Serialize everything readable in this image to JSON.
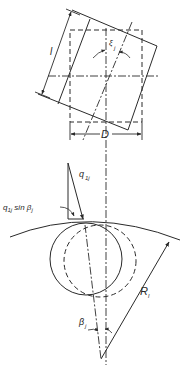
{
  "diagram": {
    "labels": {
      "length": "l",
      "diameter": "D",
      "skew_angle": "ξ",
      "skew_angle_sub": "j",
      "force": "q",
      "force_sub": "1j",
      "force_component": "q",
      "force_component_sub": "1j",
      "force_component_rest": " sin β",
      "force_component_rest_sub": "j",
      "radius": "R",
      "radius_sub": "l",
      "contact_angle": "β",
      "contact_angle_sub": "j"
    },
    "colors": {
      "line": "#2a2a2a",
      "background": "#ffffff"
    }
  }
}
